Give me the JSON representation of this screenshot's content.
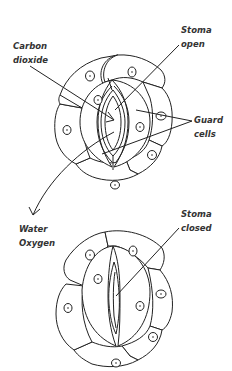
{
  "diagram": {
    "labels": {
      "carbon_dioxide_line1": "Carbon",
      "carbon_dioxide_line2": "dioxide",
      "stoma_open_line1": "Stoma",
      "stoma_open_line2": "open",
      "guard_cells_line1": "Guard",
      "guard_cells_line2": "cells",
      "water": "Water",
      "oxygen": "Oxygen",
      "stoma_closed_line1": "Stoma",
      "stoma_closed_line2": "closed"
    },
    "colors": {
      "stroke": "#222222",
      "fill": "#ffffff",
      "text": "#333333"
    }
  }
}
